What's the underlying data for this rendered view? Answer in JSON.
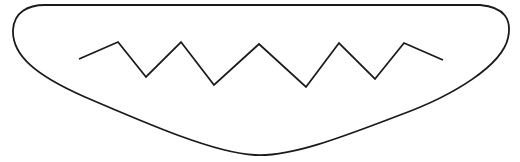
{
  "drawing": {
    "description": "Line drawing of a rounded elongated shape (like a mouth/boat) containing a zigzag line",
    "stroke_color": "#1a1a1a",
    "background_color": "#ffffff",
    "zigzag_points": [
      [
        79,
        59
      ],
      [
        118,
        42
      ],
      [
        146,
        77
      ],
      [
        181,
        42
      ],
      [
        214,
        85
      ],
      [
        259,
        44
      ],
      [
        306,
        87
      ],
      [
        339,
        43
      ],
      [
        375,
        79
      ],
      [
        404,
        43
      ],
      [
        443,
        60
      ]
    ]
  }
}
